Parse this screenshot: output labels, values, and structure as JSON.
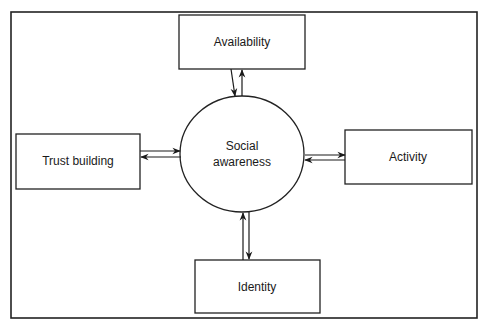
{
  "diagram": {
    "type": "concept-map",
    "center": {
      "id": "social-awareness",
      "lines": [
        "Social",
        "awareness"
      ]
    },
    "nodes": [
      {
        "id": "availability",
        "label": "Availability"
      },
      {
        "id": "trust-building",
        "label": "Trust building"
      },
      {
        "id": "activity",
        "label": "Activity"
      },
      {
        "id": "identity",
        "label": "Identity"
      }
    ],
    "edges": [
      {
        "from": "availability",
        "to": "social-awareness",
        "direction": "bidirectional"
      },
      {
        "from": "trust-building",
        "to": "social-awareness",
        "direction": "bidirectional"
      },
      {
        "from": "activity",
        "to": "social-awareness",
        "direction": "bidirectional"
      },
      {
        "from": "identity",
        "to": "social-awareness",
        "direction": "bidirectional"
      }
    ]
  }
}
